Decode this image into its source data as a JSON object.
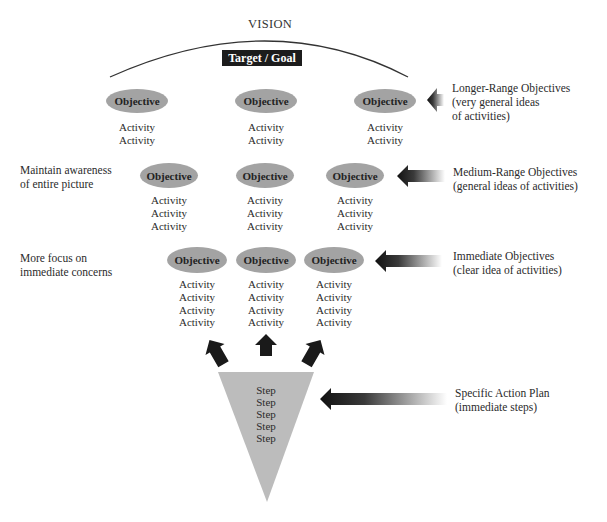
{
  "header": {
    "vision": "VISION",
    "target_goal": "Target / Goal"
  },
  "rows": [
    {
      "name": "longer-range",
      "objectives": [
        {
          "label": "Objective",
          "activities": [
            "Activity",
            "Activity"
          ]
        },
        {
          "label": "Objective",
          "activities": [
            "Activity",
            "Activity"
          ]
        },
        {
          "label": "Objective",
          "activities": [
            "Activity",
            "Activity"
          ]
        }
      ],
      "side_label": [
        "Longer-Range Objectives",
        "(very general ideas",
        "of activities)"
      ]
    },
    {
      "name": "medium-range",
      "objectives": [
        {
          "label": "Objective",
          "activities": [
            "Activity",
            "Activity",
            "Activity"
          ]
        },
        {
          "label": "Objective",
          "activities": [
            "Activity",
            "Activity",
            "Activity"
          ]
        },
        {
          "label": "Objective",
          "activities": [
            "Activity",
            "Activity",
            "Activity"
          ]
        }
      ],
      "side_label": [
        "Medium-Range Objectives",
        "(general ideas of activities)"
      ],
      "left_note": [
        "Maintain awareness",
        "of entire picture"
      ]
    },
    {
      "name": "immediate",
      "objectives": [
        {
          "label": "Objective",
          "activities": [
            "Activity",
            "Activity",
            "Activity",
            "Activity"
          ]
        },
        {
          "label": "Objective",
          "activities": [
            "Activity",
            "Activity",
            "Activity",
            "Activity"
          ]
        },
        {
          "label": "Objective",
          "activities": [
            "Activity",
            "Activity",
            "Activity",
            "Activity"
          ]
        }
      ],
      "side_label": [
        "Immediate Objectives",
        "(clear idea of activities)"
      ],
      "left_note": [
        "More focus on",
        "immediate concerns"
      ]
    }
  ],
  "action_plan": {
    "steps": [
      "Step",
      "Step",
      "Step",
      "Step",
      "Step"
    ],
    "side_label": [
      "Specific Action Plan",
      "(immediate steps)"
    ]
  },
  "colors": {
    "objective_fill": "#a3a3a3",
    "funnel_fill": "#bcbcbc",
    "target_box": "#1c1c1c",
    "arrow_dark": "#111111"
  }
}
